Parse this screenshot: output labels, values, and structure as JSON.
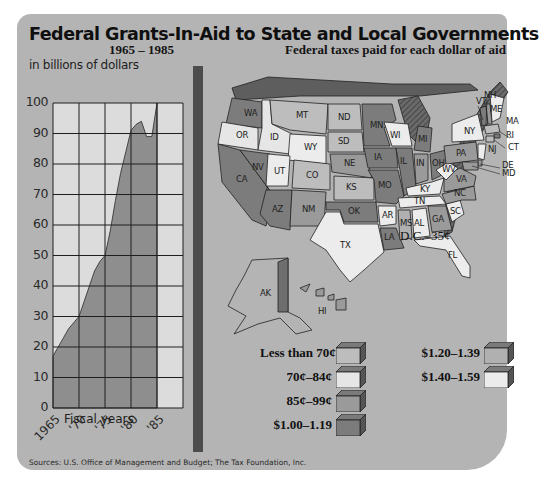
{
  "title": "Federal Grants-In-Aid to State and Local Governments",
  "left_panel": {
    "subtitle": "1965 – 1985",
    "units": "in billions of dollars",
    "x_axis_label": "Fiscal years"
  },
  "right_panel": {
    "subtitle": "Federal taxes paid for each dollar of aid",
    "dc_note": "D.C.–35¢"
  },
  "colors": {
    "panel_bg": "#b4b4b4",
    "plot_bg": "#dcdcdc",
    "plot_fill": "#8e8e8e",
    "divider": "#4c4c4c",
    "less_than_70": "#bdbdbd",
    "70_84": "#e6e6e6",
    "85_99": "#9a9a9a",
    "1_00_1_19": "#7c7c7c",
    "1_20_1_39": "#b0b0b0",
    "1_40_1_59": "#ececec"
  },
  "legend": {
    "items": [
      {
        "label": "Less than 70¢",
        "color": "#bdbdbd"
      },
      {
        "label": "70¢–84¢",
        "color": "#e6e6e6"
      },
      {
        "label": "85¢–99¢",
        "color": "#9a9a9a"
      },
      {
        "label": "$1.00–1.19",
        "color": "#7c7c7c"
      },
      {
        "label": "$1.20–1.39",
        "color": "#b0b0b0"
      },
      {
        "label": "$1.40–1.59",
        "color": "#ececec"
      }
    ]
  },
  "states": [
    "WA",
    "OR",
    "CA",
    "ID",
    "NV",
    "MT",
    "WY",
    "UT",
    "AZ",
    "CO",
    "NM",
    "ND",
    "SD",
    "NE",
    "KS",
    "OK",
    "TX",
    "MN",
    "IA",
    "MO",
    "AR",
    "LA",
    "WI",
    "IL",
    "MI",
    "IN",
    "OH",
    "KY",
    "TN",
    "MS",
    "AL",
    "GA",
    "FL",
    "SC",
    "NC",
    "VA",
    "WV",
    "PA",
    "NY",
    "VT",
    "NH",
    "ME",
    "MA",
    "RI",
    "CT",
    "NJ",
    "DE",
    "MD",
    "AK",
    "HI"
  ],
  "source": "Sources: U.S. Office of Management and Budget; The Tax Foundation, Inc.",
  "chart_data": {
    "type": "area",
    "title": "Federal Grants-In-Aid to State and Local Governments",
    "subtitle": "1965–1985",
    "xlabel": "Fiscal years",
    "ylabel": "in billions of dollars",
    "x": [
      1965,
      1966,
      1967,
      1968,
      1969,
      1970,
      1971,
      1972,
      1973,
      1974,
      1975,
      1976,
      1977,
      1978,
      1979,
      1980,
      1981,
      1982,
      1983,
      1984,
      1985
    ],
    "values": [
      17,
      20,
      23,
      26,
      28,
      30,
      35,
      40,
      45,
      48,
      50,
      58,
      68,
      77,
      84,
      91,
      93,
      94,
      89,
      89,
      100
    ],
    "x_tick_labels": [
      "1965",
      "'70",
      "'75",
      "'80",
      "'85"
    ],
    "y_ticks": [
      0,
      10,
      20,
      30,
      40,
      50,
      60,
      70,
      80,
      90,
      100
    ],
    "xlim": [
      1965,
      1990
    ],
    "ylim": [
      0,
      100
    ],
    "grid": true,
    "legend_position": "none"
  }
}
